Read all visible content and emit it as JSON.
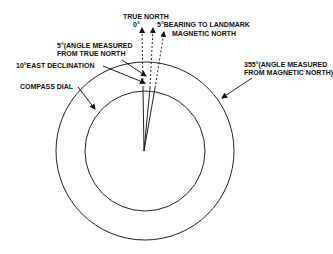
{
  "diagram": {
    "labels": {
      "true_north": "TRUE NORTH",
      "true_north_deg": "0°",
      "bearing": "5°BEARING TO LANDMARK",
      "magnetic_north": "MAGNETIC NORTH",
      "angle_true_1": "5°(ANGLE MEASURED",
      "angle_true_2": "FROM TRUE NORTH",
      "declination": "10°EAST DECLINATION",
      "compass_dial": "COMPASS DIAL",
      "angle_mag_1": "355°(ANGLE MEASURED",
      "angle_mag_2": "FROM MAGNETIC NORTH)"
    }
  }
}
